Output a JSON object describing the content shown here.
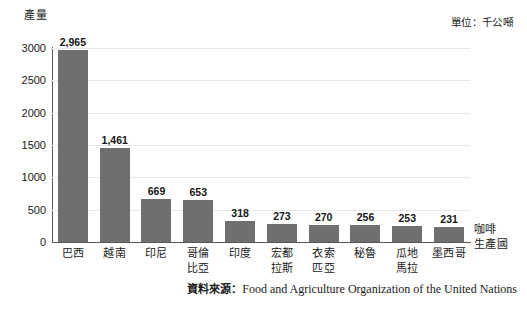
{
  "chart_data": {
    "type": "bar",
    "title": "",
    "ylabel": "產量",
    "xlabel": "咖啡\n生產國",
    "unit_note": "單位：千公噸",
    "categories": [
      "巴西",
      "越南",
      "印尼",
      "哥倫\n比亞",
      "印度",
      "宏都\n拉斯",
      "衣索\n匹亞",
      "秘魯",
      "瓜地\n馬拉",
      "墨西哥"
    ],
    "values": [
      2965,
      1461,
      669,
      653,
      318,
      273,
      270,
      256,
      253,
      231
    ],
    "value_labels": [
      "2,965",
      "1,461",
      "669",
      "653",
      "318",
      "273",
      "270",
      "256",
      "253",
      "231"
    ],
    "ylim": [
      0,
      3000
    ],
    "yticks": [
      3000,
      2500,
      2000,
      1500,
      1000,
      500,
      0
    ],
    "ytick_labels": [
      "3000",
      "2500",
      "2000",
      "1500",
      "1000",
      "500",
      "0"
    ],
    "grid": true,
    "legend": "none",
    "bar_color": "#6f6f6f",
    "gridline_color": "#e9e9e9",
    "axis_color": "#575757"
  },
  "source": {
    "label": "資料來源：",
    "text": "Food and Agriculture Organization of the United Nations"
  }
}
